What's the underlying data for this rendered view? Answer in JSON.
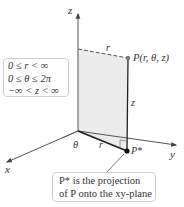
{
  "diagram": {
    "axes": {
      "x_label": "x",
      "y_label": "y",
      "z_label": "z"
    },
    "labels": {
      "point_P": "P(r, θ, z)",
      "point_P_star": "P*",
      "r_top": "r",
      "r_bottom": "r",
      "z_height": "z",
      "theta": "θ"
    },
    "range_box": {
      "lines": [
        "0 ≤ r < ∞",
        "0 ≤ θ ≤ 2π",
        "−∞ < z < ∞"
      ]
    },
    "note_box": {
      "lines": [
        "P* is the projection",
        "of P onto the xy-plane"
      ]
    },
    "colors": {
      "plane_fill": "#ececec",
      "axis": "#444444",
      "text": "#333333",
      "box_border": "#cfcfcf"
    }
  }
}
